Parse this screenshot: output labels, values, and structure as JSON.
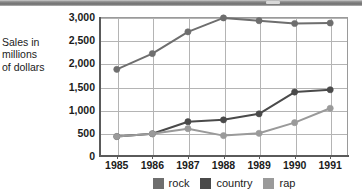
{
  "header": {
    "bar_color": "#7a7a7a",
    "notch_name": "header-notch"
  },
  "chart_data": {
    "type": "line",
    "title": "",
    "xlabel": "",
    "ylabel": "Sales in millions of dollars",
    "ylabel_lines": [
      "Sales in",
      "millions",
      "of dollars"
    ],
    "categories": [
      "1985",
      "1986",
      "1987",
      "1988",
      "1989",
      "1990",
      "1991"
    ],
    "ylim": [
      0,
      3000
    ],
    "yticks": [
      "0",
      "500",
      "1,000",
      "1,500",
      "2,000",
      "2,500",
      "3,000"
    ],
    "ytick_values": [
      0,
      500,
      1000,
      1500,
      2000,
      2500,
      3000
    ],
    "grid": true,
    "legend_position": "bottom",
    "series": [
      {
        "name": "rock",
        "color": "#6e6e6e",
        "values": [
          1870,
          2210,
          2680,
          2980,
          2920,
          2860,
          2870
        ]
      },
      {
        "name": "country",
        "color": "#4a4a4a",
        "values": [
          420,
          480,
          740,
          780,
          910,
          1380,
          1430
        ]
      },
      {
        "name": "rap",
        "color": "#9a9a9a",
        "values": [
          420,
          480,
          590,
          440,
          490,
          720,
          1030
        ]
      }
    ]
  },
  "legend": {
    "items": [
      {
        "label": "rock",
        "color": "#6e6e6e"
      },
      {
        "label": "country",
        "color": "#4a4a4a"
      },
      {
        "label": "rap",
        "color": "#9a9a9a"
      }
    ]
  },
  "axes": {
    "grid_color": "#b4b4b4",
    "axis_color": "#5a5a5a",
    "frame_color": "#9a9a9a"
  }
}
